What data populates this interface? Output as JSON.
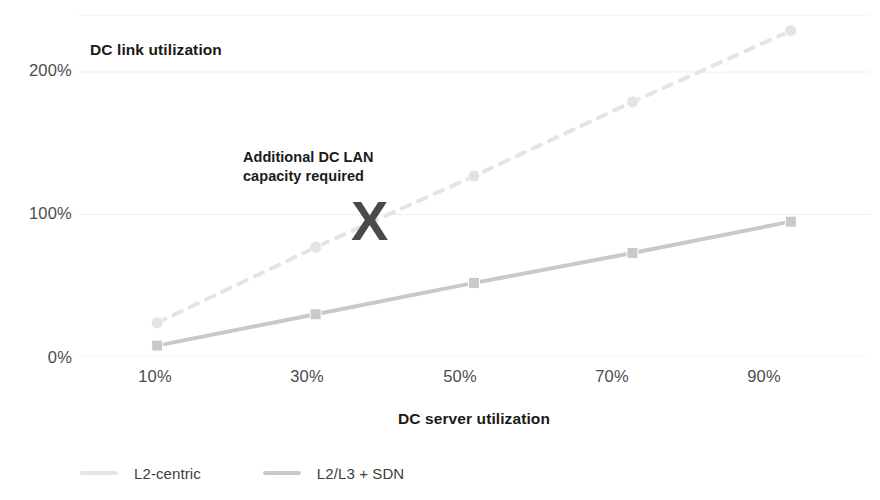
{
  "chart_data": {
    "type": "line",
    "title": "DC link utilization",
    "xlabel": "DC server utilization",
    "ylabel": "",
    "categories": [
      "10%",
      "30%",
      "50%",
      "70%",
      "90%"
    ],
    "x": [
      10,
      30,
      50,
      70,
      90
    ],
    "ytick_labels": [
      "0%",
      "100%",
      "200%"
    ],
    "ytick_values": [
      0,
      100,
      200
    ],
    "ylim": [
      0,
      240
    ],
    "xlim": [
      0,
      100
    ],
    "grid": "horizontal",
    "legend_position": "bottom-left",
    "series": [
      {
        "name": "L2-centric",
        "style": "dashed",
        "marker": "circle",
        "color": "#e4e4e4",
        "values": [
          24,
          77,
          127,
          179,
          229
        ]
      },
      {
        "name": "L2/L3 + SDN",
        "style": "solid",
        "marker": "square",
        "color": "#c9c9c9",
        "values": [
          8,
          30,
          52,
          73,
          95
        ]
      }
    ],
    "annotations": [
      {
        "text_line_1": "Additional DC LAN",
        "text_line_2": "capacity required",
        "marker": "X",
        "color": "#4a4a4a"
      }
    ]
  },
  "colors": {
    "background": "#ffffff",
    "grid": "#f0f0f0",
    "tick_text": "#4d4d4d",
    "title_text": "#1a1a1a",
    "series_l2_centric": "#e4e4e4",
    "series_l2l3_sdn": "#c9c9c9",
    "annotation": "#4a4a4a"
  }
}
